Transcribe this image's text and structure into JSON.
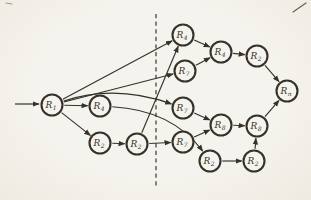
{
  "figure": {
    "type": "directed-graph",
    "colors": {
      "paper": "#f5f3ed",
      "ink": "#35322c",
      "divider_ink": "#44413a"
    },
    "divider": {
      "style": "dashed",
      "x": 156,
      "y1": 14,
      "y2": 186
    },
    "entry_arrow": {
      "x1": 15,
      "y1": 104,
      "x2": 39,
      "y2": 104
    },
    "node_radius": 10.5,
    "nodes": [
      {
        "id": "n1",
        "label": "R",
        "sub": "1",
        "x": 52,
        "y": 105
      },
      {
        "id": "n2",
        "label": "R",
        "sub": "4",
        "x": 100,
        "y": 106
      },
      {
        "id": "n3",
        "label": "R",
        "sub": "2",
        "x": 100,
        "y": 143
      },
      {
        "id": "n4",
        "label": "R",
        "sub": "2",
        "x": 137,
        "y": 144
      },
      {
        "id": "n5",
        "label": "R",
        "sub": "4",
        "x": 183,
        "y": 35
      },
      {
        "id": "n6",
        "label": "R",
        "sub": "7",
        "x": 185,
        "y": 71
      },
      {
        "id": "n7",
        "label": "R",
        "sub": "7",
        "x": 183,
        "y": 108
      },
      {
        "id": "n8",
        "label": "R",
        "sub": "7",
        "x": 183,
        "y": 142
      },
      {
        "id": "n9",
        "label": "R",
        "sub": "2",
        "x": 210,
        "y": 161
      },
      {
        "id": "n10",
        "label": "R",
        "sub": "4",
        "x": 221,
        "y": 52
      },
      {
        "id": "n11",
        "label": "R",
        "sub": "8",
        "x": 221,
        "y": 125
      },
      {
        "id": "n12",
        "label": "R",
        "sub": "2",
        "x": 257,
        "y": 56
      },
      {
        "id": "n13",
        "label": "R",
        "sub": "8",
        "x": 257,
        "y": 126
      },
      {
        "id": "n14",
        "label": "R",
        "sub": "2",
        "x": 254,
        "y": 161
      },
      {
        "id": "n15",
        "label": "R",
        "sub": "n",
        "x": 287,
        "y": 91
      }
    ],
    "edges": [
      {
        "from": "n1",
        "to": "n2"
      },
      {
        "from": "n1",
        "to": "n3"
      },
      {
        "from": "n1",
        "to": "n5"
      },
      {
        "from": "n1",
        "to": "n6"
      },
      {
        "from": "n1",
        "to": "n7",
        "curve": {
          "x": 115,
          "y": 84
        }
      },
      {
        "from": "n2",
        "to": "n9",
        "curve": {
          "x": 172,
          "y": 110
        }
      },
      {
        "from": "n3",
        "to": "n4"
      },
      {
        "from": "n4",
        "to": "n5"
      },
      {
        "from": "n4",
        "to": "n8"
      },
      {
        "from": "n5",
        "to": "n10"
      },
      {
        "from": "n6",
        "to": "n10"
      },
      {
        "from": "n7",
        "to": "n11"
      },
      {
        "from": "n8",
        "to": "n11"
      },
      {
        "from": "n9",
        "to": "n14"
      },
      {
        "from": "n10",
        "to": "n12"
      },
      {
        "from": "n11",
        "to": "n13"
      },
      {
        "from": "n12",
        "to": "n15"
      },
      {
        "from": "n13",
        "to": "n15"
      },
      {
        "from": "n14",
        "to": "n13"
      }
    ],
    "artifacts": [
      {
        "x1": 293,
        "y1": 12,
        "x2": 306,
        "y2": 3,
        "w": 1.2,
        "opacity": 0.75
      },
      {
        "x1": 6,
        "y1": 3,
        "x2": 12,
        "y2": 4,
        "w": 1.0,
        "opacity": 0.45
      }
    ]
  }
}
